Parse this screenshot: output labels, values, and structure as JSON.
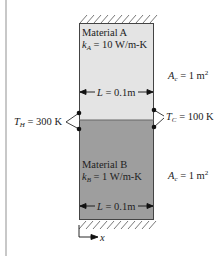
{
  "diagram": {
    "type": "composite-wall-heat-conduction",
    "material_a": {
      "name": "Material A",
      "k_symbol": "k",
      "k_sub": "A",
      "k_value": "= 10 W/m-K",
      "fill_color": "#e4e4e4",
      "length_label_sym": "L",
      "length_label_val": "= 0.1m",
      "area_sym": "A",
      "area_sub": "c",
      "area_val": "= 1 m",
      "area_exp": "2"
    },
    "material_b": {
      "name": "Material B",
      "k_symbol": "k",
      "k_sub": "B",
      "k_value": "= 1 W/m-K",
      "fill_color": "#9e9e9e",
      "length_label_sym": "L",
      "length_label_val": "= 0.1m",
      "area_sym": "A",
      "area_sub": "c",
      "area_val": "= 1 m",
      "area_exp": "2"
    },
    "hot_side": {
      "sym": "T",
      "sub": "H",
      "val": "= 300 K"
    },
    "cold_side": {
      "sym": "T",
      "sub": "C",
      "val": "= 100 K"
    },
    "axis": {
      "label": "x"
    }
  }
}
